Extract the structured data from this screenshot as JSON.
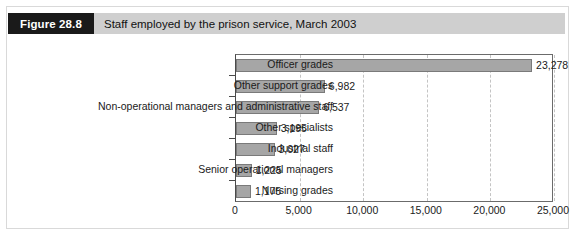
{
  "figure": {
    "tag": "Figure 28.8",
    "title": "Staff employed by the prison service, March 2003"
  },
  "chart_data": {
    "type": "bar",
    "orientation": "horizontal",
    "title": "Staff employed by the prison service, March 2003",
    "xlabel": "",
    "ylabel": "",
    "categories": [
      "Officer grades",
      "Other support  grades",
      "Non-operational managers and administrative staff",
      "Other specialists",
      "Industrial staff",
      "Senior operational managers",
      "Nursing grades"
    ],
    "values": [
      23278,
      6982,
      6537,
      3195,
      3027,
      1225,
      1175
    ],
    "value_labels": [
      "23,278",
      "6,982",
      "6,537",
      "3,195",
      "3,027",
      "1,225",
      "1,175"
    ],
    "xlim": [
      0,
      25000
    ],
    "xticks": [
      0,
      5000,
      10000,
      15000,
      20000,
      25000
    ],
    "xtick_labels": [
      "0",
      "5,000",
      "10,000",
      "15,000",
      "20,000",
      "25,000"
    ],
    "grid": "vertical-dashed",
    "legend": "none",
    "bar_color": "#a6a6a6",
    "bar_border_color": "#7a7a7a"
  },
  "colors": {
    "header_tag_bg": "#1a1a1a",
    "header_tag_text": "#ffffff",
    "header_band_bg": "#cfcfcf",
    "frame_border": "#d9d9d9",
    "axis": "#4a4a4a",
    "gridline": "#c4c4c4",
    "text": "#1a1a1a"
  }
}
